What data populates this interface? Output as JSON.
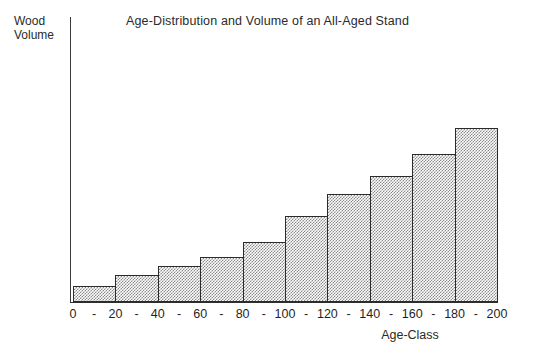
{
  "chart_data": {
    "type": "bar",
    "title": "Age-Distribution and Volume of an All-Aged Stand",
    "xlabel": "Age-Class",
    "ylabel": "Wood\nVolume",
    "grid": false,
    "legend": false,
    "axis_boundaries": [
      "0",
      "20",
      "40",
      "60",
      "80",
      "100",
      "120",
      "140",
      "160",
      "180",
      "200"
    ],
    "boundary_separator": "-",
    "categories": [
      "0 - 20",
      "20 - 40",
      "40 - 60",
      "60 - 80",
      "80 - 100",
      "100 - 120",
      "120 - 140",
      "140 - 160",
      "160 - 180",
      "180 - 200"
    ],
    "values": [
      16,
      27,
      36,
      45,
      60,
      86,
      108,
      126,
      148,
      174
    ],
    "value_units": "relative wood volume (px-derived)",
    "ylim": [
      0,
      285
    ],
    "y_ticks_shown": false,
    "bar_fill": "#8a8a8a",
    "bar_fill_style": "50% checkerboard dither",
    "bar_edge_color": "#2b2b2b"
  },
  "figure": {
    "background": "#ffffff",
    "axis_color": "#2e2e2e"
  }
}
